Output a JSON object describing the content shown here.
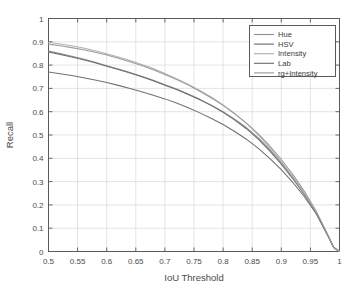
{
  "chart_data": {
    "type": "line",
    "title": "",
    "xlabel": "IoU Threshold",
    "ylabel": "Recall",
    "xlim": [
      0.5,
      1.0
    ],
    "ylim": [
      0.0,
      1.0
    ],
    "grid": true,
    "legend_position": "top-right",
    "xticks": [
      "0.5",
      "0.55",
      "0.6",
      "0.65",
      "0.7",
      "0.75",
      "0.8",
      "0.85",
      "0.9",
      "0.95",
      "1"
    ],
    "xtick_values": [
      0.5,
      0.55,
      0.6,
      0.65,
      0.7,
      0.75,
      0.8,
      0.85,
      0.9,
      0.95,
      1.0
    ],
    "yticks": [
      "0",
      "0.1",
      "0.2",
      "0.3",
      "0.4",
      "0.5",
      "0.6",
      "0.7",
      "0.8",
      "0.9",
      "1"
    ],
    "ytick_values": [
      0,
      0.1,
      0.2,
      0.3,
      0.4,
      0.5,
      0.6,
      0.7,
      0.8,
      0.9,
      1.0
    ],
    "x": [
      0.5,
      0.52,
      0.54,
      0.56,
      0.58,
      0.6,
      0.62,
      0.64,
      0.66,
      0.68,
      0.7,
      0.72,
      0.74,
      0.76,
      0.78,
      0.8,
      0.82,
      0.84,
      0.86,
      0.88,
      0.9,
      0.92,
      0.94,
      0.96,
      0.98,
      0.99,
      1.0
    ],
    "series": [
      {
        "name": "Hue",
        "color": "#8f8f8f",
        "values": [
          0.86,
          0.85,
          0.838,
          0.826,
          0.812,
          0.797,
          0.783,
          0.768,
          0.752,
          0.735,
          0.716,
          0.697,
          0.676,
          0.653,
          0.628,
          0.6,
          0.568,
          0.532,
          0.489,
          0.438,
          0.381,
          0.318,
          0.248,
          0.168,
          0.07,
          0.018,
          0.0
        ]
      },
      {
        "name": "HSV",
        "color": "#6e6e6e",
        "values": [
          0.856,
          0.846,
          0.835,
          0.823,
          0.81,
          0.795,
          0.781,
          0.766,
          0.75,
          0.733,
          0.714,
          0.695,
          0.674,
          0.651,
          0.626,
          0.597,
          0.564,
          0.527,
          0.483,
          0.432,
          0.375,
          0.312,
          0.243,
          0.164,
          0.068,
          0.017,
          0.0
        ]
      },
      {
        "name": "Intensity",
        "color": "#b0b0b0",
        "values": [
          0.898,
          0.891,
          0.883,
          0.873,
          0.862,
          0.849,
          0.835,
          0.82,
          0.803,
          0.785,
          0.764,
          0.742,
          0.718,
          0.691,
          0.662,
          0.629,
          0.592,
          0.55,
          0.502,
          0.447,
          0.386,
          0.32,
          0.248,
          0.167,
          0.069,
          0.017,
          0.0
        ]
      },
      {
        "name": "Lab",
        "color": "#707070",
        "values": [
          0.77,
          0.763,
          0.755,
          0.746,
          0.736,
          0.725,
          0.713,
          0.7,
          0.686,
          0.671,
          0.655,
          0.637,
          0.617,
          0.595,
          0.571,
          0.545,
          0.515,
          0.482,
          0.444,
          0.4,
          0.351,
          0.296,
          0.234,
          0.162,
          0.069,
          0.017,
          0.0
        ]
      },
      {
        "name": "rg+Intensity",
        "color": "#9c9c9c",
        "values": [
          0.89,
          0.883,
          0.875,
          0.866,
          0.855,
          0.843,
          0.829,
          0.814,
          0.798,
          0.78,
          0.76,
          0.738,
          0.714,
          0.688,
          0.659,
          0.627,
          0.591,
          0.551,
          0.506,
          0.454,
          0.395,
          0.33,
          0.257,
          0.173,
          0.072,
          0.018,
          0.0
        ]
      }
    ]
  }
}
